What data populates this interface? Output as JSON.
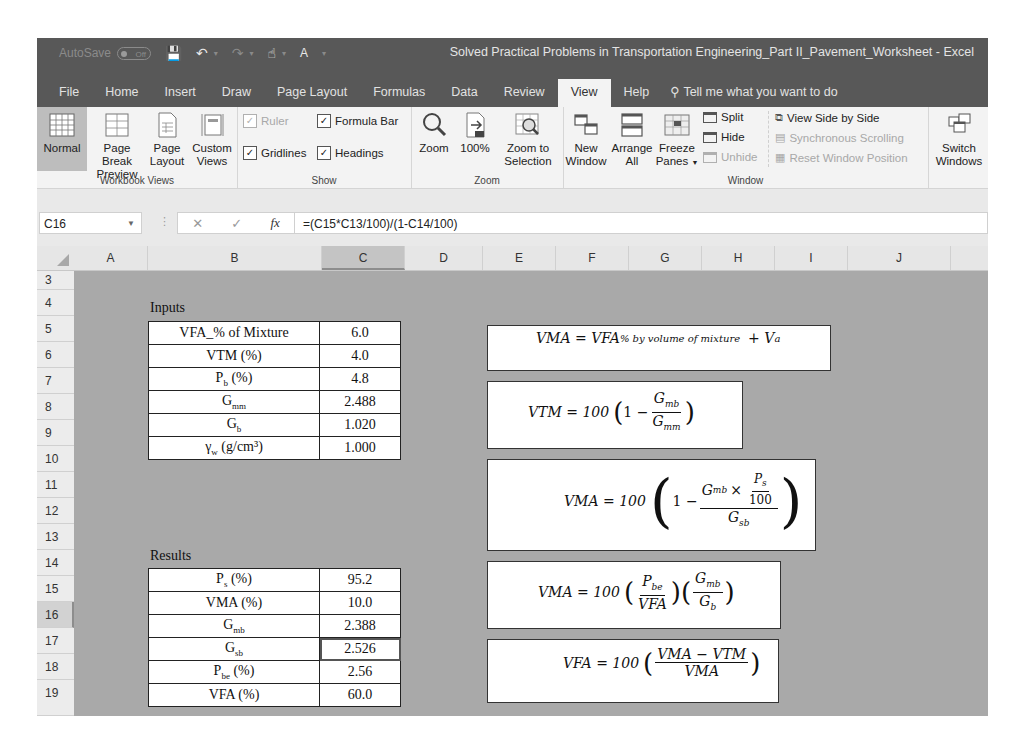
{
  "titlebar": {
    "autosave_label": "AutoSave",
    "autosave_state": "Off",
    "document_title": "Solved Practical Problems in Transportation Engineering_Part II_Pavement_Worksheet  -  Excel"
  },
  "tabs": [
    {
      "label": "File"
    },
    {
      "label": "Home"
    },
    {
      "label": "Insert"
    },
    {
      "label": "Draw"
    },
    {
      "label": "Page Layout"
    },
    {
      "label": "Formulas"
    },
    {
      "label": "Data"
    },
    {
      "label": "Review"
    },
    {
      "label": "View",
      "active": true
    },
    {
      "label": "Help"
    }
  ],
  "tell_me": "Tell me what you want to do",
  "ribbon": {
    "workbook_views": {
      "label": "Workbook Views",
      "normal": "Normal",
      "page_break_1": "Page Break",
      "page_break_2": "Preview",
      "page_layout_1": "Page",
      "page_layout_2": "Layout",
      "custom_1": "Custom",
      "custom_2": "Views"
    },
    "show": {
      "label": "Show",
      "ruler": "Ruler",
      "formula_bar": "Formula Bar",
      "gridlines": "Gridlines",
      "headings": "Headings"
    },
    "zoom": {
      "label": "Zoom",
      "zoom": "Zoom",
      "hundred": "100%",
      "zoom_sel_1": "Zoom to",
      "zoom_sel_2": "Selection"
    },
    "window": {
      "label": "Window",
      "new_1": "New",
      "new_2": "Window",
      "arrange_1": "Arrange",
      "arrange_2": "All",
      "freeze_1": "Freeze",
      "freeze_2": "Panes",
      "split": "Split",
      "hide": "Hide",
      "unhide": "Unhide",
      "side_by_side": "View Side by Side",
      "sync_scroll": "Synchronous Scrolling",
      "reset_pos": "Reset Window Position",
      "switch_1": "Switch",
      "switch_2": "Windows"
    }
  },
  "formula_bar": {
    "name_box": "C16",
    "formula": "=(C15*C13/100)/(1-C14/100)"
  },
  "columns": [
    "A",
    "B",
    "C",
    "D",
    "E",
    "F",
    "G",
    "H",
    "I",
    "J"
  ],
  "selected_column": "C",
  "rows": [
    "3",
    "4",
    "5",
    "6",
    "7",
    "8",
    "9",
    "10",
    "11",
    "12",
    "13",
    "14",
    "15",
    "16",
    "17",
    "18",
    "19"
  ],
  "selected_row": "16",
  "inputs": {
    "title": "Inputs",
    "rows": [
      {
        "label": "VFA_% of Mixture",
        "sub": "",
        "suffix": "",
        "value": "6.0"
      },
      {
        "label": "VTM (%)",
        "sub": "",
        "suffix": "",
        "value": "4.0"
      },
      {
        "label": "P",
        "sub": "b",
        "suffix": " (%)",
        "value": "4.8"
      },
      {
        "label": "G",
        "sub": "mm",
        "suffix": "",
        "value": "2.488"
      },
      {
        "label": "G",
        "sub": "b",
        "suffix": "",
        "value": "1.020"
      },
      {
        "label": "γ",
        "sub": "w",
        "suffix": " (g/cm³)",
        "value": "1.000"
      }
    ]
  },
  "results": {
    "title": "Results",
    "rows": [
      {
        "label": "P",
        "sub": "s",
        "suffix": " (%)",
        "value": "95.2"
      },
      {
        "label": "VMA (%)",
        "sub": "",
        "suffix": "",
        "value": "10.0"
      },
      {
        "label": "G",
        "sub": "mb",
        "suffix": "",
        "value": "2.388"
      },
      {
        "label": "G",
        "sub": "sb",
        "suffix": "",
        "value": "2.526"
      },
      {
        "label": "P",
        "sub": "be",
        "suffix": " (%)",
        "value": "2.56"
      },
      {
        "label": "VFA (%)",
        "sub": "",
        "suffix": "",
        "value": "60.0"
      }
    ]
  },
  "equations": {
    "eq1": {
      "lhs": "VMA = VFA",
      "sub": "% by volume of mixture",
      "tail": "+ V",
      "tail_sub": "a"
    },
    "eq2": {
      "lhs": "VTM = 100",
      "one": "1 −",
      "num": "G",
      "num_sub": "mb",
      "den": "G",
      "den_sub": "mm"
    },
    "eq3": {
      "lhs": "VMA = 100",
      "one": "1 −",
      "num": "G",
      "num_sub": "mb",
      "times": "×",
      "inner_num": "P",
      "inner_num_sub": "s",
      "inner_den": "100",
      "den": "G",
      "den_sub": "sb"
    },
    "eq4": {
      "lhs": "VMA = 100",
      "n1": "P",
      "n1_sub": "be",
      "d1": "VFA",
      "n2": "G",
      "n2_sub": "mb",
      "d2": "G",
      "d2_sub": "b"
    },
    "eq5": {
      "lhs": "VFA = 100",
      "num": "VMA − VTM",
      "den": "VMA"
    }
  }
}
